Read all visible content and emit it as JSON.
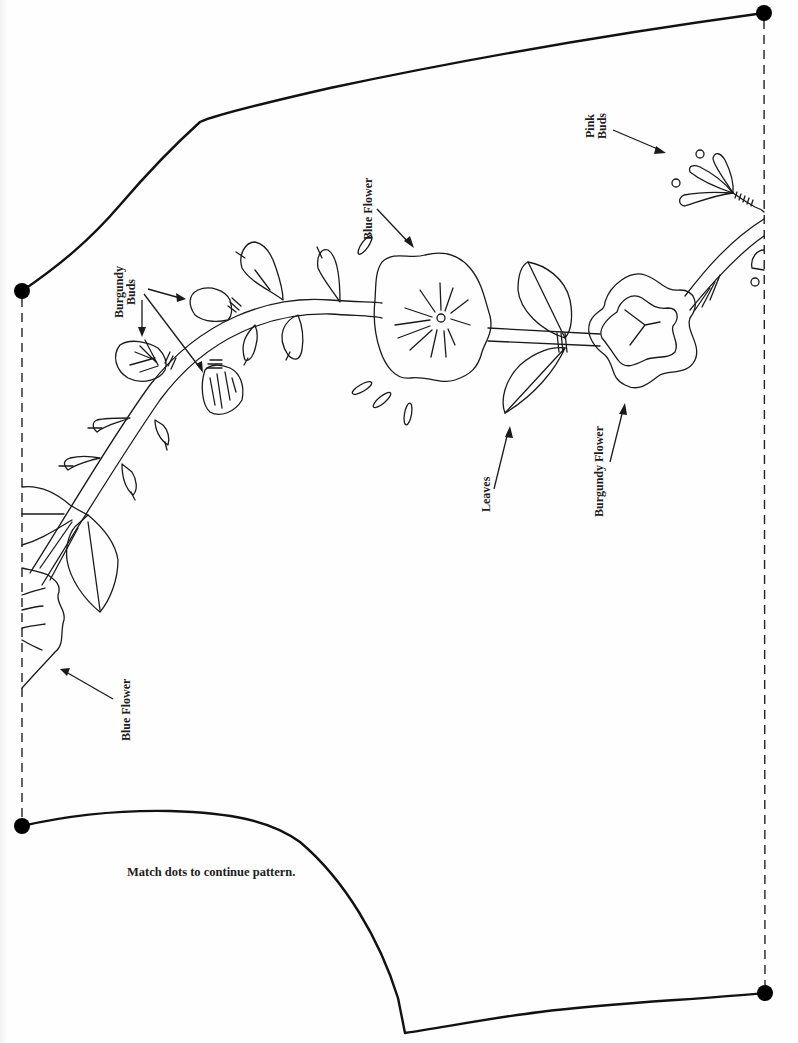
{
  "diagram": {
    "type": "embroidery-pattern",
    "colors": {
      "line": "#111111",
      "background": "#fefefe"
    },
    "labels": {
      "burgundy_buds_line1": "Burgundy",
      "burgundy_buds_line2": "Buds",
      "blue_flower_top": "Blue Flower",
      "pink_buds_line1": "Pink",
      "pink_buds_line2": "Buds",
      "leaves": "Leaves",
      "burgundy_flower": "Burgundy Flower",
      "blue_flower_bottom": "Blue Flower"
    },
    "note": "Match dots to continue pattern.",
    "match_dots": [
      {
        "id": "top-left",
        "x": 22,
        "y": 291
      },
      {
        "id": "top-right",
        "x": 764,
        "y": 13
      },
      {
        "id": "bottom-left",
        "x": 22,
        "y": 826
      },
      {
        "id": "bottom-right",
        "x": 765,
        "y": 993
      }
    ],
    "motifs": [
      "Blue Flower",
      "Burgundy Buds",
      "Leaves",
      "Burgundy Flower",
      "Pink Buds"
    ]
  }
}
